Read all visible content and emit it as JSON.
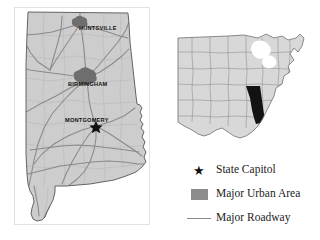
{
  "figure": {
    "name": "alabama-reference-map",
    "background_color": "#ffffff"
  },
  "state_map": {
    "name": "alabama-state-map",
    "state": "Alabama",
    "fill_color": "#cdcdcd",
    "outline_color": "#555555",
    "road_color": "#8a8a8a",
    "urban_color": "#6e6e6e",
    "cities": [
      {
        "name": "HUNTSVILLE",
        "type": "major-urban-area",
        "marker": "urban-blob"
      },
      {
        "name": "BIRMINGHAM",
        "type": "major-urban-area",
        "marker": "urban-blob"
      },
      {
        "name": "MONTGOMERY",
        "type": "state-capitol",
        "marker": "star"
      }
    ]
  },
  "locator_map": {
    "name": "eastern-united-states-locator",
    "highlight_state": "Alabama",
    "highlight_color": "#121212",
    "fill_color": "#d8d8d8",
    "outline_color": "#6f6f6f"
  },
  "legend": {
    "name": "map-legend",
    "items": [
      {
        "symbol": "star-icon",
        "label": "State Capitol",
        "color": "#111111"
      },
      {
        "symbol": "square-icon",
        "label": "Major Urban Area",
        "color": "#8c8c8c"
      },
      {
        "symbol": "line-icon",
        "label": "Major Roadway",
        "color": "#8a8a8a"
      }
    ]
  }
}
